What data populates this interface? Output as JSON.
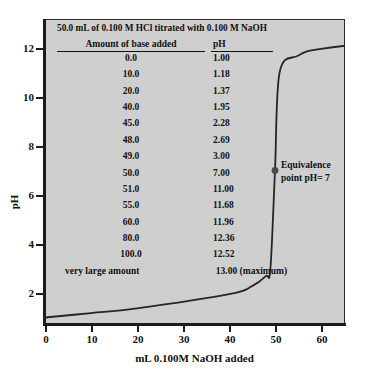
{
  "chart_data": {
    "type": "line",
    "title": "50.0 mL of 0.100 M HCl titrated with 0.100 M NaOH",
    "xlabel": "mL 0.100M NaOH added",
    "ylabel": "pH",
    "xlim": [
      0,
      65
    ],
    "ylim": [
      0,
      13
    ],
    "xticks": [
      "0",
      "10",
      "20",
      "30",
      "40",
      "50",
      "60"
    ],
    "yticks": [
      "2",
      "4",
      "6",
      "8",
      "10",
      "12"
    ],
    "grid": false,
    "legend": "none",
    "x": [
      0.0,
      10.0,
      20.0,
      40.0,
      45.0,
      48.0,
      49.0,
      50.0,
      51.0,
      55.0,
      60.0,
      80.0,
      100.0
    ],
    "y": [
      1.0,
      1.18,
      1.37,
      1.95,
      2.28,
      2.69,
      3.0,
      7.0,
      11.0,
      11.68,
      11.96,
      12.36,
      12.52
    ],
    "series": [
      {
        "name": "Titration curve",
        "values": [
          1.0,
          1.18,
          1.37,
          1.95,
          2.28,
          2.69,
          3.0,
          7.0,
          11.0,
          11.68,
          11.96,
          12.36,
          12.52
        ]
      }
    ],
    "annotations": [
      {
        "label_line1": "Equivalence",
        "label_line2": "point pH= 7",
        "x": 50.0,
        "y": 7.0
      }
    ],
    "table": {
      "headers": [
        "Amount of base added",
        "pH"
      ],
      "rows": [
        [
          "0.0",
          "1.00"
        ],
        [
          "10.0",
          "1.18"
        ],
        [
          "20.0",
          "1.37"
        ],
        [
          "40.0",
          "1.95"
        ],
        [
          "45.0",
          "2.28"
        ],
        [
          "48.0",
          "2.69"
        ],
        [
          "49.0",
          "3.00"
        ],
        [
          "50.0",
          "7.00"
        ],
        [
          "51.0",
          "11.00"
        ],
        [
          "55.0",
          "11.68"
        ],
        [
          "60.0",
          "11.96"
        ],
        [
          "80.0",
          "12.36"
        ],
        [
          "100.0",
          "12.52"
        ],
        [
          "very large amount",
          "13.00 (maximum)"
        ]
      ]
    },
    "colors": {
      "plot_background": "#cfcfcf",
      "curve": "#262626",
      "axis": "#1c1c1c",
      "text": "#111111",
      "page_background": "#ffffff"
    }
  }
}
